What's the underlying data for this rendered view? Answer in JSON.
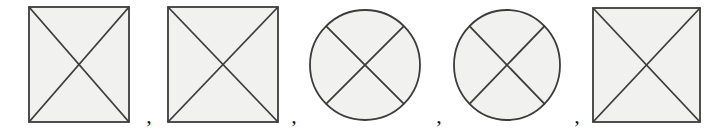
{
  "figure": {
    "name": "shape-sequence-figure",
    "width": 718,
    "height": 130,
    "background_color": "#ffffff"
  },
  "palette": {
    "background": "#ffffff",
    "shape_fill": "#f1f1ef",
    "shape_stroke": "#3c3c3c",
    "cross_stroke": "#3c3c3c",
    "separator_color": "#1a1a1a"
  },
  "style": {
    "outline_width": 1.8,
    "cross_width": 1.8
  },
  "items": [
    {
      "index": 1,
      "name": "square-with-x-1",
      "type": "square",
      "label": "square",
      "cx": 79,
      "cy": 64.5,
      "width": 100,
      "height": 115,
      "x": 29,
      "y": 7
    },
    {
      "index": 2,
      "name": "square-with-x-2",
      "type": "square",
      "label": "square",
      "cx": 223,
      "cy": 64.5,
      "width": 110,
      "height": 115,
      "x": 168,
      "y": 7
    },
    {
      "index": 3,
      "name": "circle-with-x-1",
      "type": "circle",
      "label": "circle",
      "cx": 365,
      "cy": 65,
      "rx": 55,
      "ry": 55
    },
    {
      "index": 4,
      "name": "circle-with-x-2",
      "type": "circle",
      "label": "circle",
      "cx": 507,
      "cy": 65,
      "rx": 53,
      "ry": 55
    },
    {
      "index": 5,
      "name": "square-with-x-3",
      "type": "square",
      "label": "square",
      "cx": 646.5,
      "cy": 65,
      "width": 107,
      "height": 114,
      "x": 593,
      "y": 8
    }
  ],
  "separators": [
    {
      "name": "comma-separator-1",
      "text": ",",
      "x": 149,
      "y": 123
    },
    {
      "name": "comma-separator-2",
      "text": ",",
      "x": 294,
      "y": 123
    },
    {
      "name": "comma-separator-3",
      "text": ",",
      "x": 439,
      "y": 123
    },
    {
      "name": "comma-separator-4",
      "text": ",",
      "x": 577,
      "y": 123
    }
  ],
  "sequence_text": "square , square , circle , circle , square"
}
